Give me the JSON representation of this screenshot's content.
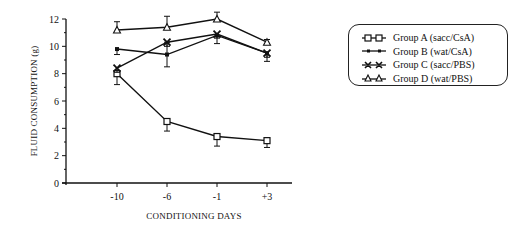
{
  "chart_data": {
    "type": "line",
    "title": "",
    "xlabel": "CONDITIONING DAYS",
    "ylabel": "FLUID CONSUMPTION (g)",
    "categories": [
      "-10",
      "-6",
      "-1",
      "+3"
    ],
    "yticks": [
      0,
      2,
      4,
      6,
      8,
      10,
      12
    ],
    "ylim": [
      0,
      12
    ],
    "grid": false,
    "legend_position": "right",
    "series": [
      {
        "name": "Group A  (sacc/CsA)",
        "marker": "open-square",
        "values": [
          8.0,
          4.5,
          3.4,
          3.1
        ],
        "err": [
          0.8,
          0.7,
          0.7,
          0.5
        ]
      },
      {
        "name": "Group B  (wat/CsA)",
        "marker": "small-filled-square",
        "values": [
          9.8,
          9.4,
          10.8,
          9.5
        ],
        "err": [
          0.4,
          0.9,
          0.6,
          0.6
        ]
      },
      {
        "name": "Group C  (sacc/PBS)",
        "marker": "x-filled",
        "values": [
          8.4,
          10.3,
          10.9,
          9.5
        ],
        "err": [
          0.3,
          0.3,
          0.3,
          0.3
        ]
      },
      {
        "name": "Group D  (wat/PBS)",
        "marker": "open-triangle",
        "values": [
          11.2,
          11.4,
          12.0,
          10.3
        ],
        "err": [
          0.6,
          0.8,
          0.5,
          0.2
        ]
      }
    ]
  },
  "axes": {
    "x_title": "CONDITIONING DAYS",
    "y_title": "FLUID CONSUMPTION (g)"
  },
  "legend": {
    "items": [
      {
        "label": "Group A  (sacc/CsA)"
      },
      {
        "label": "Group B  (wat/CsA)"
      },
      {
        "label": "Group C  (sacc/PBS)"
      },
      {
        "label": "Group D  (wat/PBS)"
      }
    ]
  }
}
